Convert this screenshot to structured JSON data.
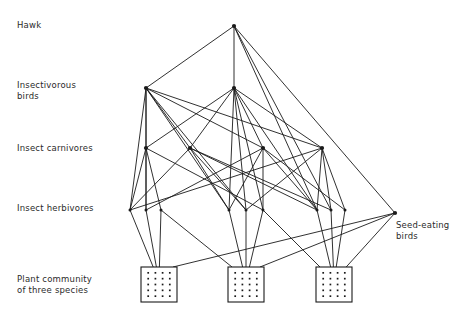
{
  "figure": {
    "background_color": "#ffffff",
    "line_color": "#1a1a1a",
    "text_color": "#2b2b2b"
  },
  "labels": {
    "hawk": "Hawk",
    "insectivorous_birds": "Insectivorous\nbirds",
    "insect_carnivores": "Insect carnivores",
    "insect_herbivores": "Insect herbivores",
    "plant_community": "Plant community\nof three species",
    "seed_eating_birds": "Seed-eating\nbirds"
  },
  "chart_data": {
    "type": "diagram",
    "subtype": "food-web",
    "trophic_levels": [
      {
        "id": "hawk",
        "label": "Hawk",
        "y": 26,
        "node_count": 1
      },
      {
        "id": "insectiv",
        "label": "Insectivorous birds",
        "y": 88,
        "node_count": 2
      },
      {
        "id": "carniv",
        "label": "Insect carnivores",
        "y": 148,
        "node_count": 4
      },
      {
        "id": "herbiv",
        "label": "Insect herbivores",
        "y": 210,
        "node_count": 9
      },
      {
        "id": "seed",
        "label": "Seed-eating birds",
        "y": 213,
        "node_count": 1
      },
      {
        "id": "plants",
        "label": "Plant community of three species",
        "y": 285,
        "node_count": 3
      }
    ],
    "nodes": [
      {
        "id": "H1",
        "level": "hawk",
        "x": 234,
        "y": 26
      },
      {
        "id": "IB1",
        "level": "insectiv",
        "x": 146,
        "y": 88
      },
      {
        "id": "IB2",
        "level": "insectiv",
        "x": 234,
        "y": 88
      },
      {
        "id": "IC1",
        "level": "carniv",
        "x": 146,
        "y": 148
      },
      {
        "id": "IC2",
        "level": "carniv",
        "x": 190,
        "y": 148
      },
      {
        "id": "IC3",
        "level": "carniv",
        "x": 263,
        "y": 148
      },
      {
        "id": "IC4",
        "level": "carniv",
        "x": 322,
        "y": 148
      },
      {
        "id": "IH1",
        "level": "herbiv",
        "x": 130,
        "y": 210
      },
      {
        "id": "IH2",
        "level": "herbiv",
        "x": 146,
        "y": 210
      },
      {
        "id": "IH3",
        "level": "herbiv",
        "x": 161,
        "y": 210
      },
      {
        "id": "IH4",
        "level": "herbiv",
        "x": 229,
        "y": 210
      },
      {
        "id": "IH5",
        "level": "herbiv",
        "x": 246,
        "y": 210
      },
      {
        "id": "IH6",
        "level": "herbiv",
        "x": 263,
        "y": 210
      },
      {
        "id": "IH7",
        "level": "herbiv",
        "x": 317,
        "y": 210
      },
      {
        "id": "IH8",
        "level": "herbiv",
        "x": 331,
        "y": 210
      },
      {
        "id": "IH9",
        "level": "herbiv",
        "x": 345,
        "y": 210
      },
      {
        "id": "SB1",
        "level": "seed",
        "x": 395,
        "y": 213
      },
      {
        "id": "P1",
        "level": "plants",
        "x": 159,
        "y": 284,
        "box": {
          "x": 141,
          "y": 267,
          "w": 36,
          "h": 35
        }
      },
      {
        "id": "P2",
        "level": "plants",
        "x": 246,
        "y": 284,
        "box": {
          "x": 228,
          "y": 267,
          "w": 36,
          "h": 35
        }
      },
      {
        "id": "P3",
        "level": "plants",
        "x": 334,
        "y": 284,
        "box": {
          "x": 316,
          "y": 267,
          "w": 36,
          "h": 35
        }
      }
    ],
    "edges": [
      {
        "from": "IB1",
        "to": "H1"
      },
      {
        "from": "IB2",
        "to": "H1"
      },
      {
        "from": "IH7",
        "to": "H1"
      },
      {
        "from": "IH8",
        "to": "H1"
      },
      {
        "from": "SB1",
        "to": "H1"
      },
      {
        "from": "IC1",
        "to": "IB1"
      },
      {
        "from": "IC2",
        "to": "IB1"
      },
      {
        "from": "IC3",
        "to": "IB1"
      },
      {
        "from": "IC4",
        "to": "IB1"
      },
      {
        "from": "IH1",
        "to": "IB1"
      },
      {
        "from": "IH2",
        "to": "IB1"
      },
      {
        "from": "IH4",
        "to": "IB1"
      },
      {
        "from": "IH5",
        "to": "IB1"
      },
      {
        "from": "IC1",
        "to": "IB2"
      },
      {
        "from": "IC2",
        "to": "IB2"
      },
      {
        "from": "IC3",
        "to": "IB2"
      },
      {
        "from": "IC4",
        "to": "IB2"
      },
      {
        "from": "IH4",
        "to": "IB2"
      },
      {
        "from": "IH5",
        "to": "IB2"
      },
      {
        "from": "IH6",
        "to": "IB2"
      },
      {
        "from": "IH7",
        "to": "IB2"
      },
      {
        "from": "IH1",
        "to": "IC1"
      },
      {
        "from": "IH2",
        "to": "IC1"
      },
      {
        "from": "IH3",
        "to": "IC1"
      },
      {
        "from": "IH6",
        "to": "IC1"
      },
      {
        "from": "IH1",
        "to": "IC2"
      },
      {
        "from": "IH4",
        "to": "IC2"
      },
      {
        "from": "IH5",
        "to": "IC2"
      },
      {
        "from": "IH7",
        "to": "IC2"
      },
      {
        "from": "IH8",
        "to": "IC2"
      },
      {
        "from": "IH2",
        "to": "IC3"
      },
      {
        "from": "IH4",
        "to": "IC3"
      },
      {
        "from": "IH6",
        "to": "IC3"
      },
      {
        "from": "IH7",
        "to": "IC3"
      },
      {
        "from": "IH9",
        "to": "IC3"
      },
      {
        "from": "IH1",
        "to": "IC4"
      },
      {
        "from": "IH5",
        "to": "IC4"
      },
      {
        "from": "IH7",
        "to": "IC4"
      },
      {
        "from": "IH8",
        "to": "IC4"
      },
      {
        "from": "IH9",
        "to": "IC4"
      },
      {
        "from": "P1",
        "to": "IH1"
      },
      {
        "from": "P1",
        "to": "IH2"
      },
      {
        "from": "P1",
        "to": "IH3"
      },
      {
        "from": "P2",
        "to": "IH4"
      },
      {
        "from": "P2",
        "to": "IH5"
      },
      {
        "from": "P2",
        "to": "IH6"
      },
      {
        "from": "P3",
        "to": "IH7"
      },
      {
        "from": "P3",
        "to": "IH8"
      },
      {
        "from": "P3",
        "to": "IH9"
      },
      {
        "from": "P2",
        "to": "IH3"
      },
      {
        "from": "P3",
        "to": "IH6"
      },
      {
        "from": "P1",
        "to": "SB1"
      },
      {
        "from": "P2",
        "to": "SB1"
      },
      {
        "from": "P3",
        "to": "SB1"
      }
    ]
  }
}
